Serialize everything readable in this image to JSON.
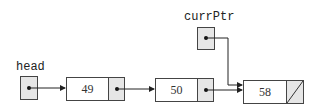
{
  "diagram": {
    "type": "linked-list",
    "pointers": [
      {
        "label": "head",
        "points_to": 0
      },
      {
        "label": "currPtr",
        "points_to": 2
      }
    ],
    "nodes": [
      {
        "value": "49",
        "next": 1
      },
      {
        "value": "50",
        "next": 2
      },
      {
        "value": "58",
        "next": null
      }
    ],
    "colors": {
      "pointer_fill": "#e6e6e6",
      "data_fill": "#ffffff",
      "stroke": "#444444"
    }
  }
}
